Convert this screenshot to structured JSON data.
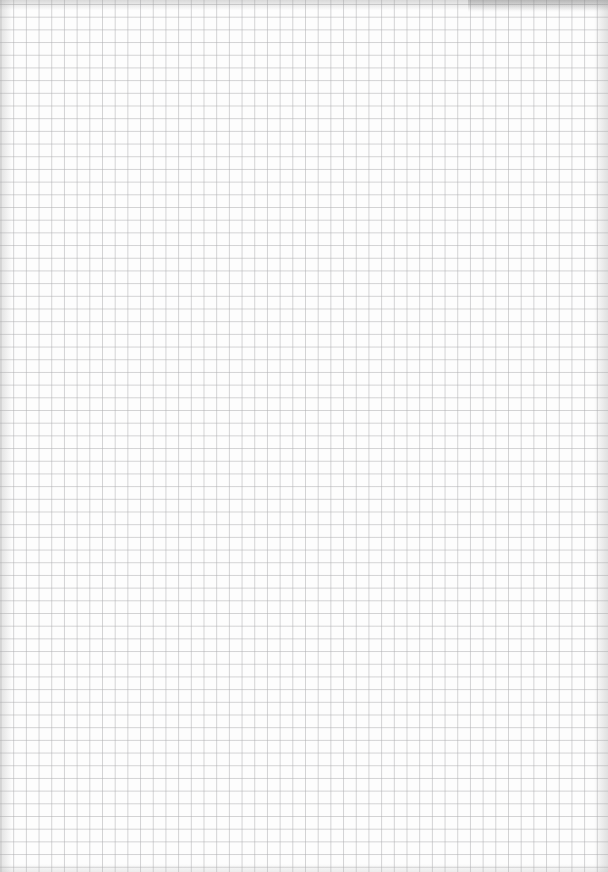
{
  "page": {
    "kind": "graph-paper-sheet",
    "description": "Blank square-grid graph paper",
    "content_text": "",
    "grid_line_color": "#afafb2",
    "paper_color": "#fdfdfd",
    "marks": []
  }
}
